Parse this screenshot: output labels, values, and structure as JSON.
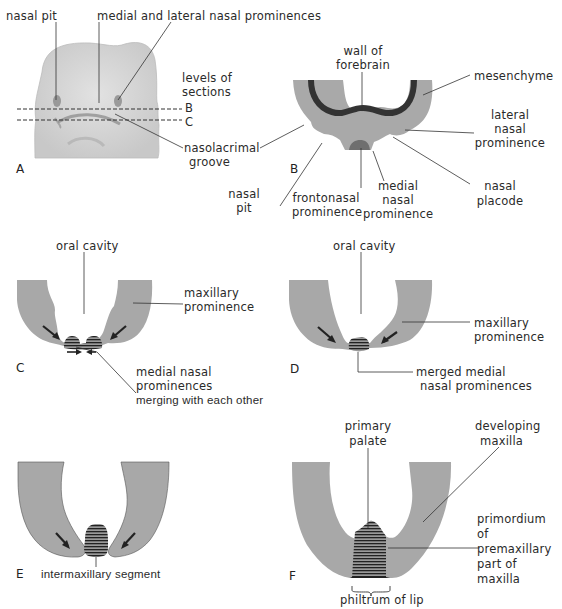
{
  "figure": {
    "colors": {
      "tissue": "#a8a8a8",
      "tissue_dark": "#8e8e8e",
      "forebrain_wall": "#333333",
      "face_fill": "#d6d6d6",
      "line": "#333333"
    },
    "panels": [
      {
        "letter": "A",
        "labels": {
          "nasal_pit": "nasal pit",
          "medial_lateral": "medial and lateral nasal  prominences",
          "levels_1": "levels  of",
          "levels_2": "sections",
          "level_b": "B",
          "level_c": "C",
          "nasolacrimal_1": "nasolacrimal",
          "nasolacrimal_2": "groove"
        }
      },
      {
        "letter": "B",
        "labels": {
          "wall_1": "wall of",
          "wall_2": "forebrain",
          "mesenchyme": "mesenchyme",
          "lateral_1": "lateral",
          "lateral_2": "nasal",
          "lateral_3": "prominence",
          "nasal_pit_1": "nasal",
          "nasal_pit_2": "pit",
          "frontonasal_1": "frontonasal",
          "frontonasal_2": "prominence",
          "medial_1": "medial",
          "medial_2": "nasal",
          "medial_3": "prominence",
          "placode_1": "nasal",
          "placode_2": "placode"
        }
      },
      {
        "letter": "C",
        "labels": {
          "oral_cavity": "oral cavity",
          "maxillary_1": "maxillary",
          "maxillary_2": "prominence",
          "medial_1": "medial nasal",
          "medial_2": "prominences",
          "medial_3": "merging with each other"
        }
      },
      {
        "letter": "D",
        "labels": {
          "oral_cavity": "oral cavity",
          "maxillary_1": "maxillary",
          "maxillary_2": "prominence",
          "merged_1": "merged medial",
          "merged_2": "nasal prominences"
        }
      },
      {
        "letter": "E",
        "labels": {
          "intermaxillary": "intermaxillary segment"
        }
      },
      {
        "letter": "F",
        "labels": {
          "primary_1": "primary",
          "primary_2": "palate",
          "developing_1": "developing",
          "developing_2": "maxilla",
          "primordium_1": "primordium",
          "primordium_2": "of",
          "primordium_3": "premaxillary",
          "primordium_4": "part of",
          "primordium_5": "maxilla",
          "philtrum": "philtrum of lip"
        }
      }
    ]
  }
}
